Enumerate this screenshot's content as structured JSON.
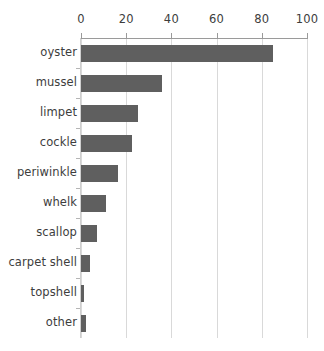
{
  "chart_data": {
    "type": "bar",
    "orientation": "horizontal",
    "title": "",
    "subtitle": "",
    "xlabel": "",
    "ylabel": "",
    "categories": [
      "oyster",
      "mussel",
      "limpet",
      "cockle",
      "periwinkle",
      "whelk",
      "scallop",
      "carpet shell",
      "topshell",
      "other"
    ],
    "values": [
      85,
      36,
      25,
      22.5,
      16.5,
      11,
      7,
      4,
      1.5,
      2
    ],
    "xlim": [
      0,
      100
    ],
    "xticks": [
      0,
      20,
      40,
      60,
      80,
      100
    ],
    "xtick_labels": [
      "0",
      "20",
      "40",
      "60",
      "80",
      "100"
    ],
    "grid": "vertical",
    "legend": "none",
    "axis_position": "top",
    "bar_color": "#5f5f5f",
    "gridline_color": "#d9d9d9",
    "axis_color": "#9a9a9a",
    "text_color": "#3d3d3d",
    "background_color": "#ffffff"
  }
}
